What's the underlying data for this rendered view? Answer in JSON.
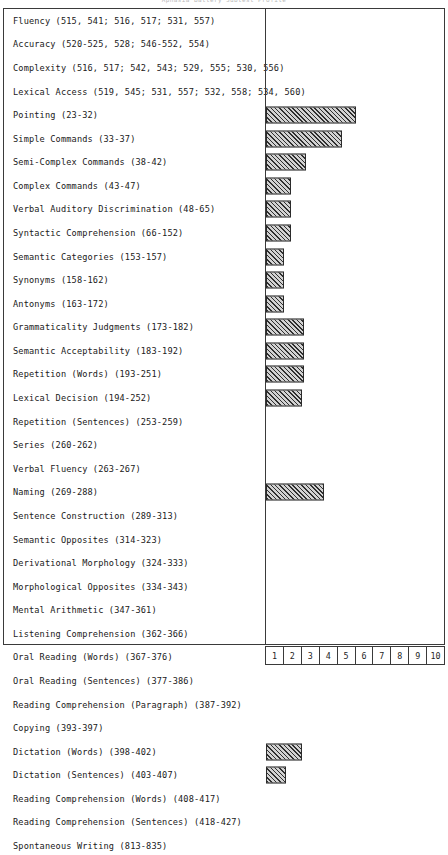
{
  "chart_title": "Aphasia Battery Subtest Profile",
  "axis": {
    "tick_labels": [
      "1",
      "2",
      "3",
      "4",
      "5",
      "6",
      "7",
      "8",
      "9",
      "10"
    ],
    "min": 0,
    "max": 10
  },
  "chart_data": {
    "type": "bar",
    "orientation": "horizontal",
    "title": "Aphasia Battery Subtest Profile",
    "xlabel": "",
    "ylabel": "",
    "xlim": [
      0,
      10
    ],
    "grid": false,
    "legend": "none",
    "categories": [
      "Fluency (515, 541; 516, 517; 531, 557)",
      "Accuracy (520-525, 528; 546-552, 554)",
      "Complexity (516, 517; 542, 543; 529, 555; 530, 556)",
      "Lexical Access (519, 545; 531, 557; 532, 558; 534, 560)",
      "Pointing (23-32)",
      "Simple Commands (33-37)",
      "Semi-Complex Commands (38-42)",
      "Complex Commands (43-47)",
      "Verbal Auditory Discrimination (48-65)",
      "Syntactic Comprehension (66-152)",
      "Semantic Categories (153-157)",
      "Synonyms (158-162)",
      "Antonyms (163-172)",
      "Grammaticality Judgments (173-182)",
      "Semantic Acceptability (183-192)",
      "Repetition (Words) (193-251)",
      "Lexical Decision (194-252)",
      "Repetition (Sentences) (253-259)",
      "Series (260-262)",
      "Verbal Fluency (263-267)",
      "Naming (269-288)",
      "Sentence Construction (289-313)",
      "Semantic Opposites (314-323)",
      "Derivational Morphology (324-333)",
      "Morphological Opposites (334-343)",
      "Mental Arithmetic (347-361)",
      "Listening Comprehension (362-366)",
      "Oral Reading (Words) (367-376)",
      "Oral Reading (Sentences) (377-386)",
      "Reading Comprehension (Paragraph) (387-392)",
      "Copying (393-397)",
      "Dictation (Words) (398-402)",
      "Dictation (Sentences) (403-407)",
      "Reading Comprehension (Words) (408-417)",
      "Reading Comprehension (Sentences) (418-427)",
      "Spontaneous Writing (813-835)"
    ],
    "values": [
      0,
      0,
      0,
      0,
      5.0,
      4.2,
      2.2,
      1.4,
      1.4,
      1.4,
      1.0,
      1.0,
      1.0,
      2.1,
      2.1,
      2.1,
      2.0,
      0,
      0,
      0,
      3.2,
      0,
      0,
      0,
      0,
      0,
      0,
      0,
      0,
      0,
      0,
      2.0,
      1.1,
      0,
      0,
      0
    ]
  }
}
